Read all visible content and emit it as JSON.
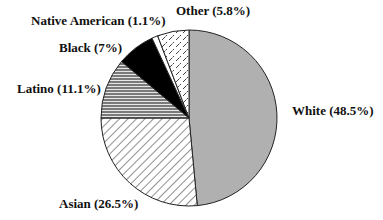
{
  "chart_data": {
    "type": "pie",
    "title": "",
    "start_angle_deg": 0,
    "direction": "clockwise",
    "slices": [
      {
        "name": "White",
        "value": 48.5,
        "label": "White (48.5%)",
        "fill": "#b0b0b0",
        "pattern": "solid"
      },
      {
        "name": "Asian",
        "value": 26.5,
        "label": "Asian (26.5%)",
        "fill": "#ffffff",
        "pattern": "diagonal-lines"
      },
      {
        "name": "Latino",
        "value": 11.1,
        "label": "Latino (11.1%)",
        "fill": "#8a8a8a",
        "pattern": "horizontal-lines"
      },
      {
        "name": "Black",
        "value": 7.0,
        "label": "Black (7%)",
        "fill": "#000000",
        "pattern": "solid"
      },
      {
        "name": "Native American",
        "value": 1.1,
        "label": "Native American (1.1%)",
        "fill": "#ffffff",
        "pattern": "solid"
      },
      {
        "name": "Other",
        "value": 5.8,
        "label": "Other (5.8%)",
        "fill": "#ffffff",
        "pattern": "dashes"
      }
    ],
    "categories": [
      "White",
      "Asian",
      "Latino",
      "Black",
      "Native American",
      "Other"
    ],
    "values": [
      48.5,
      26.5,
      11.1,
      7.0,
      1.1,
      5.8
    ],
    "unit": "%",
    "legend": "none (direct labels)"
  },
  "labels": {
    "white": "White (48.5%)",
    "asian": "Asian (26.5%)",
    "latino": "Latino (11.1%)",
    "black": "Black (7%)",
    "native_american": "Native American (1.1%)",
    "other": "Other (5.8%)"
  }
}
